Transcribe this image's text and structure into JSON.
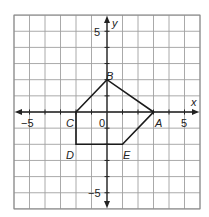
{
  "diagram": {
    "type": "coordinate-plane",
    "x_range": [
      -6,
      6
    ],
    "y_range": [
      -6,
      6
    ],
    "axes": {
      "x_label": "x",
      "y_label": "y"
    },
    "tick_labels": {
      "x": [
        {
          "value": -5,
          "text": "−5"
        },
        {
          "value": 5,
          "text": "5"
        }
      ],
      "y": [
        {
          "value": 5,
          "text": "5"
        },
        {
          "value": -5,
          "text": "−5"
        }
      ],
      "origin": "0"
    },
    "polygon": {
      "name": "pentagon ABEDC",
      "vertices": [
        {
          "label": "A",
          "x": 3,
          "y": 0
        },
        {
          "label": "B",
          "x": 0,
          "y": 2
        },
        {
          "label": "C",
          "x": -2,
          "y": 0
        },
        {
          "label": "D",
          "x": -2,
          "y": -2
        },
        {
          "label": "E",
          "x": 1,
          "y": -2
        }
      ],
      "edge_order": [
        "A",
        "B",
        "C",
        "D",
        "E"
      ]
    },
    "colors": {
      "grid": "#a0a0a0",
      "axis": "#222222",
      "polygon": "#1a1a1a",
      "background": "#ffffff"
    }
  }
}
